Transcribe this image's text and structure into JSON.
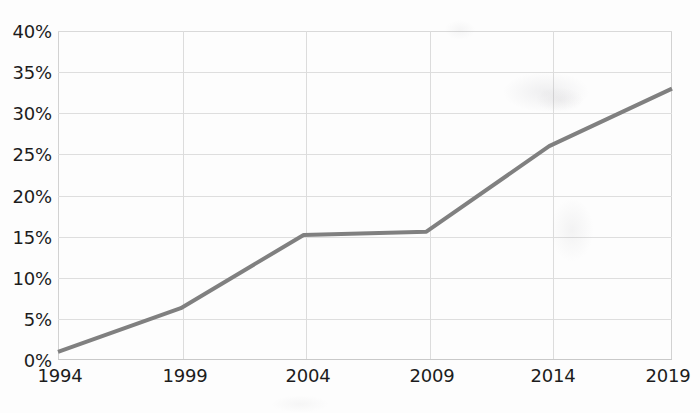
{
  "chart_data": {
    "type": "line",
    "title": "",
    "subtitle": "",
    "xlabel": "",
    "ylabel": "",
    "x": [
      1994,
      1999,
      2004,
      2009,
      2014,
      2019
    ],
    "categories": [
      "1994",
      "1999",
      "2004",
      "2009",
      "2014",
      "2019"
    ],
    "values": [
      1,
      6.3,
      15.2,
      15.6,
      26,
      33
    ],
    "series": [
      {
        "name": "",
        "values": [
          1,
          6.3,
          15.2,
          15.6,
          26,
          33
        ],
        "color": "#808080"
      }
    ],
    "xlim": [
      1994,
      2019
    ],
    "ylim": [
      0,
      40
    ],
    "ytick_values": [
      0,
      5,
      10,
      15,
      20,
      25,
      30,
      35,
      40
    ],
    "ytick_labels": [
      "0%",
      "5%",
      "10%",
      "15%",
      "20%",
      "25%",
      "30%",
      "35%",
      "40%"
    ],
    "xtick_labels": [
      "1994",
      "1999",
      "2004",
      "2009",
      "2014",
      "2019"
    ],
    "grid": "both",
    "legend": "none",
    "line_color": "#808080",
    "line_width": 4
  },
  "axes": {
    "y": {
      "ticks": [
        {
          "label": "40%",
          "value": 40
        },
        {
          "label": "35%",
          "value": 35
        },
        {
          "label": "30%",
          "value": 30
        },
        {
          "label": "25%",
          "value": 25
        },
        {
          "label": "20%",
          "value": 20
        },
        {
          "label": "15%",
          "value": 15
        },
        {
          "label": "10%",
          "value": 10
        },
        {
          "label": "5%",
          "value": 5
        },
        {
          "label": "0%",
          "value": 0
        }
      ]
    },
    "x": {
      "ticks": [
        {
          "label": "1994",
          "value": 1994
        },
        {
          "label": "1999",
          "value": 1999
        },
        {
          "label": "2004",
          "value": 2004
        },
        {
          "label": "2009",
          "value": 2009
        },
        {
          "label": "2014",
          "value": 2014
        },
        {
          "label": "2019",
          "value": 2019
        }
      ]
    }
  },
  "colors": {
    "line": "#808080",
    "grid": "#dedede",
    "axis": "#c9c9c9",
    "text": "#1c1c1c",
    "background": "#fdfdfd"
  }
}
